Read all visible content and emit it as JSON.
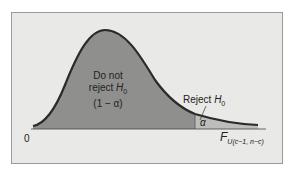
{
  "diagram": {
    "type": "F-distribution rejection region",
    "acceptance_region": {
      "line1": "Do not",
      "line2_prefix": "reject ",
      "hypothesis": "H",
      "hypothesis_sub": "0",
      "probability": "(1 − α)"
    },
    "rejection_region": {
      "label_prefix": "Reject ",
      "hypothesis": "H",
      "hypothesis_sub": "0",
      "probability": "α"
    },
    "axis": {
      "origin_label": "0",
      "variable": "F",
      "variable_sub": "U(c−1, n−c)"
    },
    "colors": {
      "background": "#e9e9e7",
      "acceptance_fill": "#8f8f8d",
      "rejection_fill": "#bdbdbb",
      "curve": "#2a2a2a"
    }
  }
}
